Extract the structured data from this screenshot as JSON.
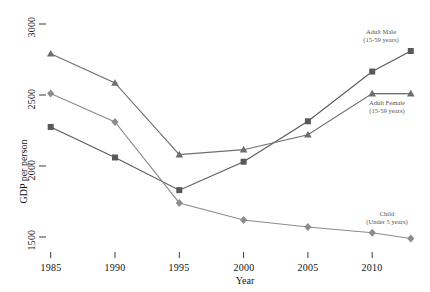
{
  "chart_data": {
    "type": "line",
    "title": "",
    "subtitle": "",
    "xlabel": "Year",
    "ylabel": "GDP per person",
    "x": [
      1985,
      1990,
      1995,
      2000,
      2005,
      2010,
      2013
    ],
    "xlim": [
      1983,
      2014
    ],
    "ylim": [
      1430,
      3050
    ],
    "grid": false,
    "legend_position": "inline-right-annotations",
    "xticks": [
      "1985",
      "1990",
      "1995",
      "2000",
      "2005",
      "2010"
    ],
    "xtick_values": [
      1985,
      1990,
      1995,
      2000,
      2005,
      2010
    ],
    "yticks": [
      "1500",
      "2000",
      "2500",
      "3000"
    ],
    "ytick_values": [
      1500,
      2000,
      2500,
      3000
    ],
    "series": [
      {
        "name": "Adult Male",
        "sublabel": "(15-59 years)",
        "marker": "square",
        "color": "#595959",
        "values": [
          2275,
          2060,
          1830,
          2030,
          2315,
          2665,
          2810
        ]
      },
      {
        "name": "Adult Female",
        "sublabel": "(15-59 years)",
        "marker": "triangle",
        "color": "#6e6e6e",
        "values": [
          2790,
          2585,
          2080,
          2115,
          2220,
          2510,
          2510
        ]
      },
      {
        "name": "Child",
        "sublabel": "(Under 5 years)",
        "marker": "diamond",
        "color": "#8c8c8c",
        "values": [
          2510,
          2310,
          1740,
          1620,
          1570,
          1530,
          1490
        ]
      }
    ],
    "annotations": [
      {
        "text": "Adult Male",
        "sub": "(15-59 years)",
        "x": 381,
        "y": 30
      },
      {
        "text": "Adult Female",
        "sub": "(15-59 years)",
        "x": 385,
        "y": 101
      },
      {
        "text": "Child",
        "sub": "(Under 5 years)",
        "x": 385,
        "y": 212
      }
    ]
  },
  "axes": {
    "y_title": "GDP per person",
    "x_title": "Year",
    "ytick_1500": "1500",
    "ytick_2000": "2000",
    "ytick_2500": "2500",
    "ytick_3000": "3000",
    "xtick_1985": "1985",
    "xtick_1990": "1990",
    "xtick_1995": "1995",
    "xtick_2000": "2000",
    "xtick_2005": "2005",
    "xtick_2010": "2010"
  },
  "colors": {
    "series_male": "#595959",
    "series_female": "#6e6e6e",
    "series_child": "#8c8c8c",
    "text": "#111111",
    "annotation_text": "#555555",
    "background": "#ffffff"
  }
}
